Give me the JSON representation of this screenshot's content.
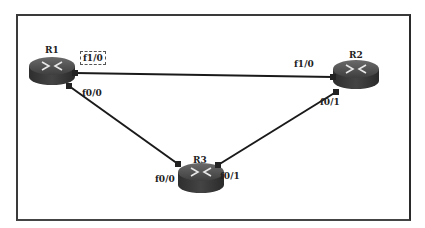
{
  "diagram": {
    "type": "network-topology",
    "routers": [
      {
        "id": "R1",
        "label": "R1"
      },
      {
        "id": "R2",
        "label": "R2"
      },
      {
        "id": "R3",
        "label": "R3"
      }
    ],
    "links": [
      {
        "from": "R1",
        "from_if": "f1/0",
        "to": "R2",
        "to_if": "f1/0"
      },
      {
        "from": "R1",
        "from_if": "f0/0",
        "to": "R3",
        "to_if": "f0/0"
      },
      {
        "from": "R2",
        "from_if": "f0/1",
        "to": "R3",
        "to_if": "f0/1"
      }
    ],
    "interface_labels": {
      "r1_f1_0": "f1/0",
      "r1_f0_0": "f0/0",
      "r2_f1_0": "f1/0",
      "r2_f0_1": "f0/1",
      "r3_f0_0": "f0/0",
      "r3_f0_1": "f0/1"
    },
    "selected_interface": "r1_f1_0",
    "colors": {
      "router_body": "#3c3c3c",
      "link": "#1a1a1a",
      "frame": "#3a3a3a"
    }
  }
}
